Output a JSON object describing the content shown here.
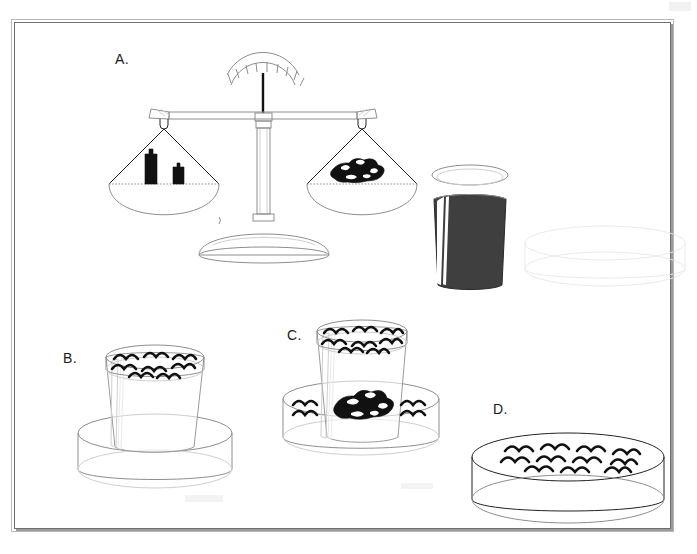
{
  "figure": {
    "background_color": "#ffffff",
    "frame_border_color": "#6f6f6f",
    "ink_color": "#111111",
    "panel_count": 4
  },
  "panels": [
    {
      "id": "A",
      "label": "A.",
      "caption": "Balance scale with weights on the left pan and rocks on the right pan, next to a cup full of water and an empty dish",
      "objects": [
        {
          "name": "balance-scale",
          "detail": "two-pan beam balance with graduated dial and pointer on a pedestal base"
        },
        {
          "name": "weights",
          "detail": "two dark metal weights, one tall and one short, on the left pan"
        },
        {
          "name": "rocks",
          "detail": "pile of dark rocks on the right pan"
        },
        {
          "name": "cup-full-of-water",
          "detail": "cup filled with dark shaded water and a white highlight stripe"
        },
        {
          "name": "empty-dish",
          "detail": "very faint outline of an empty dish at right"
        }
      ]
    },
    {
      "id": "B",
      "label": "B.",
      "caption": "Cup filled to the brim with water, standing inside an empty dish",
      "objects": [
        {
          "name": "cup",
          "detail": "clear cup with water surface at the rim marked by wave lines"
        },
        {
          "name": "dish",
          "detail": "empty shallow cylindrical dish under the cup"
        }
      ]
    },
    {
      "id": "C",
      "label": "C.",
      "caption": "Rocks placed in the cup make water overflow into the dish below",
      "objects": [
        {
          "name": "cup",
          "detail": "clear cup still full to the rim, wave lines at the water surface"
        },
        {
          "name": "rocks",
          "detail": "pile of dark rocks submerged in the cup"
        },
        {
          "name": "dish-with-water",
          "detail": "dish now holding overflowed water shown by wave lines on both sides"
        }
      ]
    },
    {
      "id": "D",
      "label": "D.",
      "caption": "The dish holding the water that was displaced by the rocks",
      "objects": [
        {
          "name": "dish-with-water",
          "detail": "shallow cylindrical dish with a water surface covered in wave lines"
        }
      ]
    }
  ],
  "balance": {
    "dial_tick_count": 9,
    "left_pan_contents": "weights",
    "right_pan_contents": "rocks",
    "state": "balanced"
  },
  "symbols": {
    "water_surface": "wave-lines",
    "rocks": "solid-black-cluster",
    "weights": "solid-black-blocks"
  }
}
